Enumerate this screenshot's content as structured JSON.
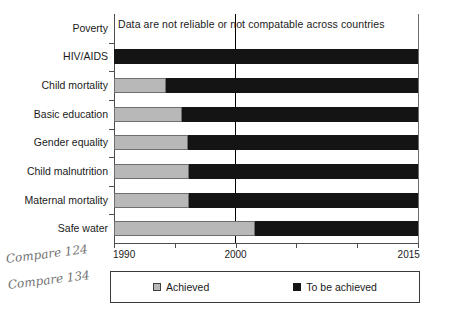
{
  "chart_data": {
    "type": "bar",
    "orientation": "horizontal",
    "title": "",
    "subtitle": "",
    "xlabel": "",
    "ylabel": "",
    "xlim": [
      1990,
      2015
    ],
    "grid": false,
    "legend_position": "bottom",
    "categories": [
      "Poverty",
      "HIV/AIDS",
      "Child mortality",
      "Basic education",
      "Gender equality",
      "Child malnutrition",
      "Maternal mortality",
      "Safe water"
    ],
    "tick_values": [
      1990,
      1995,
      2000,
      2005,
      2010,
      2015
    ],
    "tick_labels": [
      "1990",
      "",
      "2000",
      "",
      "",
      "2015"
    ],
    "labeled_ticks": [
      "1990",
      "2000",
      "2015"
    ],
    "emphasis_line": 2000,
    "series": [
      {
        "name": "Achieved",
        "color": "#b8b8b8",
        "values": [
          null,
          1990.0,
          1994.3,
          1995.6,
          1996.1,
          1996.2,
          1996.2,
          2001.6
        ]
      },
      {
        "name": "To be achieved",
        "color": "#141414",
        "values": [
          null,
          2015,
          2015,
          2015,
          2015,
          2015,
          2015,
          2015
        ]
      }
    ],
    "bars": [
      {
        "category": "Poverty",
        "achieved_start": 1990,
        "achieved_end": null,
        "todo_end": null,
        "note": "Data are not reliable or not compatable across countries"
      },
      {
        "category": "HIV/AIDS",
        "achieved_start": 1990,
        "achieved_end": 1990.0,
        "todo_end": 2015
      },
      {
        "category": "Child mortality",
        "achieved_start": 1990,
        "achieved_end": 1994.3,
        "todo_end": 2015
      },
      {
        "category": "Basic education",
        "achieved_start": 1990,
        "achieved_end": 1995.6,
        "todo_end": 2015
      },
      {
        "category": "Gender equality",
        "achieved_start": 1990,
        "achieved_end": 1996.1,
        "todo_end": 2015
      },
      {
        "category": "Child malnutrition",
        "achieved_start": 1990,
        "achieved_end": 1996.2,
        "todo_end": 2015
      },
      {
        "category": "Maternal mortality",
        "achieved_start": 1990,
        "achieved_end": 1996.2,
        "todo_end": 2015
      },
      {
        "category": "Safe water",
        "achieved_start": 1990,
        "achieved_end": 2001.6,
        "todo_end": 2015
      }
    ],
    "annotations": [
      {
        "text": "Data are not reliable or not compatable across countries",
        "attached_to": "Poverty"
      }
    ]
  },
  "legend": {
    "items": [
      {
        "label": "Achieved",
        "color": "#b8b8b8"
      },
      {
        "label": "To be achieved",
        "color": "#141414"
      }
    ]
  },
  "marginalia": {
    "note_1": "Compare 124",
    "note_2": "Compare 134"
  },
  "colors": {
    "achieved": "#b8b8b8",
    "to_be_achieved": "#141414",
    "axis": "#4d4d4d",
    "emphasis_rule": "#000000",
    "background": "#ffffff"
  }
}
